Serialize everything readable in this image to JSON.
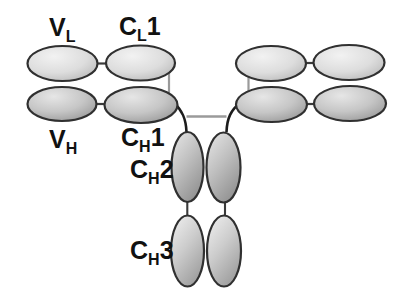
{
  "labels": {
    "vl": {
      "letter": "V",
      "subscript": "L",
      "number": ""
    },
    "cl1": {
      "letter": "C",
      "subscript": "L",
      "number": "1"
    },
    "vh": {
      "letter": "V",
      "subscript": "H",
      "number": ""
    },
    "ch1": {
      "letter": "C",
      "subscript": "H",
      "number": "1"
    },
    "ch2": {
      "letter": "C",
      "subscript": "H",
      "number": "2"
    },
    "ch3": {
      "letter": "C",
      "subscript": "H",
      "number": "3"
    }
  },
  "colors": {
    "background": "#ffffff",
    "text": "#111111",
    "outline": "#303030",
    "hinge_curve": "#1c1c1c",
    "connector_dark": "#3a3a3a",
    "connector_gray": "#9a9a9a",
    "upper_fill": {
      "start": "#f2f2f2",
      "mid": "#dddddd",
      "end": "#b4b4b4"
    },
    "lower_fill": {
      "start": "#e6e6e6",
      "mid": "#c6c6c6",
      "end": "#8e8e8e"
    },
    "stem_upper_fill": {
      "start": "#e3e3e3",
      "mid": "#bfbfbf",
      "end": "#8f8f8f"
    },
    "stem_lower_fill": {
      "start": "#ededed",
      "mid": "#cccccc",
      "end": "#9b9b9b"
    }
  }
}
